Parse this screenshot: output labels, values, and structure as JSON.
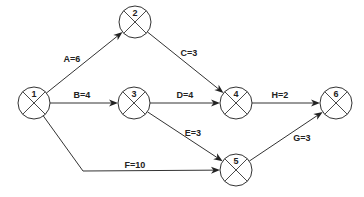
{
  "diagram": {
    "type": "activity-on-arrow network",
    "node_radius": 16,
    "colors": {
      "stroke": "#333333",
      "text": "#222222",
      "background": "#ffffff"
    },
    "nodes": [
      {
        "id": "1",
        "label": "1",
        "x": 34,
        "y": 103
      },
      {
        "id": "2",
        "label": "2",
        "x": 135,
        "y": 22
      },
      {
        "id": "3",
        "label": "3",
        "x": 134,
        "y": 103
      },
      {
        "id": "4",
        "label": "4",
        "x": 236,
        "y": 103
      },
      {
        "id": "5",
        "label": "5",
        "x": 236,
        "y": 170
      },
      {
        "id": "6",
        "label": "6",
        "x": 336,
        "y": 103
      }
    ],
    "edges": [
      {
        "id": "A",
        "label": "A=6",
        "from": "1",
        "to": "2",
        "label_x": 72,
        "label_y": 62
      },
      {
        "id": "B",
        "label": "B=4",
        "from": "1",
        "to": "3",
        "label_x": 82,
        "label_y": 98
      },
      {
        "id": "C",
        "label": "C=3",
        "from": "2",
        "to": "4",
        "label_x": 189,
        "label_y": 56
      },
      {
        "id": "D",
        "label": "D=4",
        "from": "3",
        "to": "4",
        "label_x": 185,
        "label_y": 98
      },
      {
        "id": "E",
        "label": "E=3",
        "from": "3",
        "to": "5",
        "label_x": 193,
        "label_y": 136
      },
      {
        "id": "F",
        "label": "F=10",
        "from": "1",
        "to": "5",
        "label_x": 135,
        "label_y": 168,
        "via": [
          [
            83,
            171
          ]
        ]
      },
      {
        "id": "G",
        "label": "G=3",
        "from": "5",
        "to": "6",
        "label_x": 302,
        "label_y": 141
      },
      {
        "id": "H",
        "label": "H=2",
        "from": "4",
        "to": "6",
        "label_x": 280,
        "label_y": 98
      }
    ]
  }
}
